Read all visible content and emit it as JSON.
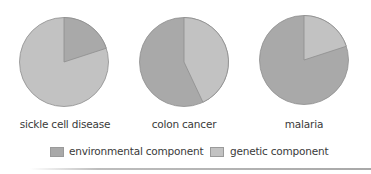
{
  "colors": {
    "environmental": "#a9a9a9",
    "genetic": "#c2c2c2",
    "stroke": "#8e8e8e"
  },
  "legend": {
    "environmental_label": "environmental component",
    "genetic_label": "genetic component"
  },
  "pies": [
    {
      "label": "sickle cell disease",
      "environmental": 20,
      "genetic": 80
    },
    {
      "label": "colon cancer",
      "environmental": 57,
      "genetic": 43
    },
    {
      "label": "malaria",
      "environmental": 80,
      "genetic": 20
    }
  ],
  "chart_data": {
    "type": "pie",
    "title": "",
    "series_names": [
      "environmental component",
      "genetic component"
    ],
    "charts": [
      {
        "title": "sickle cell disease",
        "categories": [
          "environmental component",
          "genetic component"
        ],
        "values": [
          20,
          80
        ]
      },
      {
        "title": "colon cancer",
        "categories": [
          "environmental component",
          "genetic component"
        ],
        "values": [
          57,
          43
        ]
      },
      {
        "title": "malaria",
        "categories": [
          "environmental component",
          "genetic component"
        ],
        "values": [
          80,
          20
        ]
      }
    ],
    "legend_position": "bottom",
    "note": "Values are estimated percentages read from slice angles; genetic slice drawn clockwise from 12 o'clock for colon cancer and malaria, environmental slice clockwise from 12 o'clock for sickle cell disease."
  }
}
